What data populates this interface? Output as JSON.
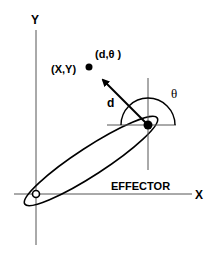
{
  "diagram": {
    "axes": {
      "x_label": "X",
      "y_label": "Y"
    },
    "point_label": "(X,Y)",
    "polar_label": "(d,θ )",
    "distance_label": "d",
    "angle_label": "θ",
    "effector_label": "EFFECTOR",
    "colors": {
      "ink": "#000000",
      "axis": "#555555",
      "background": "#ffffff"
    }
  }
}
